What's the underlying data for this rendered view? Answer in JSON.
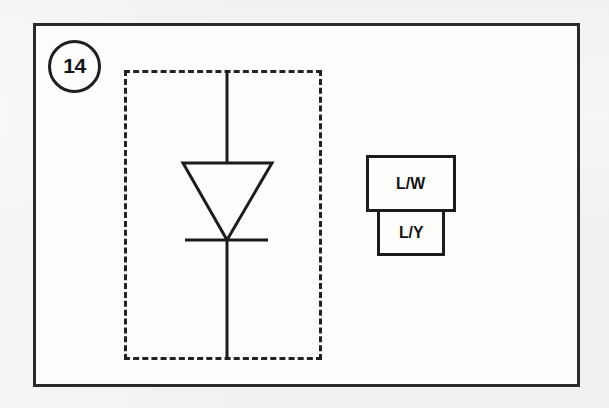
{
  "figure": {
    "number_label": "14",
    "badge_name": "figure-number-badge"
  },
  "diagram": {
    "enclosure_style": "dashed",
    "component": {
      "type": "diode",
      "symbol_name": "diode-symbol",
      "orientation": "cathode-down"
    }
  },
  "connectors": [
    {
      "label": "L/W",
      "name": "connector-box-upper",
      "size": "wide"
    },
    {
      "label": "L/Y",
      "name": "connector-box-lower",
      "size": "narrow"
    }
  ],
  "colors": {
    "ink": "#1c1c1c",
    "paper": "#fdfdfc",
    "background": "#f2f1ef"
  }
}
